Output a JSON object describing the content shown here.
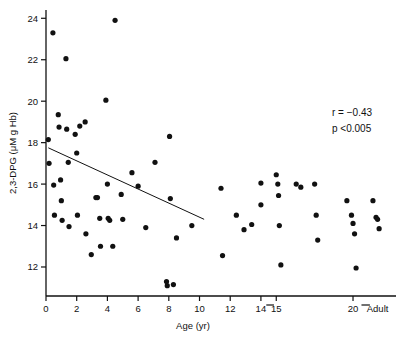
{
  "chart_data": {
    "type": "scatter",
    "title": "",
    "xlabel": "Age (yr)",
    "ylabel": "2,3-DPG (μM g Hb)",
    "xlim": [
      0,
      22.8
    ],
    "ylim": [
      10.6,
      24.4
    ],
    "grid": false,
    "legend": null,
    "x_ticks": [
      0,
      2,
      4,
      6,
      8,
      10,
      12,
      14,
      15,
      20
    ],
    "x_tick_labels": [
      "0",
      "2",
      "4",
      "6",
      "8",
      "10",
      "12",
      "14",
      "15",
      "20"
    ],
    "x_extra_tick_label": "Adult",
    "y_ticks": [
      12,
      14,
      16,
      18,
      20,
      22,
      24
    ],
    "y_tick_labels": [
      "12",
      "14",
      "16",
      "18",
      "20",
      "22",
      "24"
    ],
    "annotations": [
      {
        "name": "correlation",
        "text": "r  =  −0.43"
      },
      {
        "name": "p-value",
        "text": "p <0.005"
      }
    ],
    "trend_line": {
      "x0": 0.15,
      "y0": 17.75,
      "x1": 10.3,
      "y1": 14.3
    },
    "points": [
      {
        "x": 0.15,
        "y": 18.15
      },
      {
        "x": 0.2,
        "y": 17.0
      },
      {
        "x": 0.45,
        "y": 23.3
      },
      {
        "x": 0.5,
        "y": 15.95
      },
      {
        "x": 0.55,
        "y": 14.5
      },
      {
        "x": 0.8,
        "y": 19.35
      },
      {
        "x": 0.85,
        "y": 18.75
      },
      {
        "x": 0.95,
        "y": 16.2
      },
      {
        "x": 1.0,
        "y": 15.2
      },
      {
        "x": 1.05,
        "y": 14.25
      },
      {
        "x": 1.3,
        "y": 22.05
      },
      {
        "x": 1.35,
        "y": 18.65
      },
      {
        "x": 1.45,
        "y": 17.05
      },
      {
        "x": 1.5,
        "y": 13.95
      },
      {
        "x": 1.9,
        "y": 18.4
      },
      {
        "x": 2.0,
        "y": 17.5
      },
      {
        "x": 2.05,
        "y": 14.5
      },
      {
        "x": 2.2,
        "y": 18.8
      },
      {
        "x": 2.55,
        "y": 19.0
      },
      {
        "x": 2.6,
        "y": 13.6
      },
      {
        "x": 2.95,
        "y": 12.6
      },
      {
        "x": 3.25,
        "y": 15.35
      },
      {
        "x": 3.35,
        "y": 15.35
      },
      {
        "x": 3.5,
        "y": 14.35
      },
      {
        "x": 3.55,
        "y": 13.0
      },
      {
        "x": 3.9,
        "y": 20.05
      },
      {
        "x": 4.0,
        "y": 16.0
      },
      {
        "x": 4.05,
        "y": 14.35
      },
      {
        "x": 4.15,
        "y": 14.25
      },
      {
        "x": 4.35,
        "y": 13.0
      },
      {
        "x": 4.5,
        "y": 23.9
      },
      {
        "x": 4.9,
        "y": 15.5
      },
      {
        "x": 5.0,
        "y": 14.3
      },
      {
        "x": 5.6,
        "y": 16.55
      },
      {
        "x": 6.0,
        "y": 15.9
      },
      {
        "x": 6.5,
        "y": 13.9
      },
      {
        "x": 7.1,
        "y": 17.05
      },
      {
        "x": 7.85,
        "y": 11.3
      },
      {
        "x": 7.9,
        "y": 11.1
      },
      {
        "x": 8.05,
        "y": 18.3
      },
      {
        "x": 8.1,
        "y": 15.3
      },
      {
        "x": 8.3,
        "y": 11.15
      },
      {
        "x": 8.5,
        "y": 13.4
      },
      {
        "x": 9.5,
        "y": 14.0
      },
      {
        "x": 11.4,
        "y": 15.8
      },
      {
        "x": 11.5,
        "y": 12.55
      },
      {
        "x": 12.4,
        "y": 14.5
      },
      {
        "x": 12.9,
        "y": 13.8
      },
      {
        "x": 13.4,
        "y": 14.05
      },
      {
        "x": 14.0,
        "y": 16.05
      },
      {
        "x": 14.0,
        "y": 15.0
      },
      {
        "x": 15.0,
        "y": 16.45
      },
      {
        "x": 15.1,
        "y": 16.0
      },
      {
        "x": 15.15,
        "y": 15.45
      },
      {
        "x": 15.2,
        "y": 14.0
      },
      {
        "x": 15.3,
        "y": 12.1
      },
      {
        "x": 16.3,
        "y": 16.0
      },
      {
        "x": 16.6,
        "y": 15.85
      },
      {
        "x": 17.5,
        "y": 16.0
      },
      {
        "x": 17.6,
        "y": 14.5
      },
      {
        "x": 17.7,
        "y": 13.3
      },
      {
        "x": 19.6,
        "y": 15.2
      },
      {
        "x": 19.9,
        "y": 14.5
      },
      {
        "x": 20.0,
        "y": 14.1
      },
      {
        "x": 20.1,
        "y": 13.6
      },
      {
        "x": 20.2,
        "y": 11.95
      },
      {
        "x": 21.3,
        "y": 15.2
      },
      {
        "x": 21.5,
        "y": 14.4
      },
      {
        "x": 21.6,
        "y": 14.3
      },
      {
        "x": 21.7,
        "y": 13.85
      }
    ],
    "axis_break_marks": [
      {
        "name": "x-axis-break-1",
        "x0": 14.35,
        "x1": 14.85
      },
      {
        "name": "x-axis-break-2",
        "x0": 20.55,
        "x1": 21.1
      }
    ]
  }
}
